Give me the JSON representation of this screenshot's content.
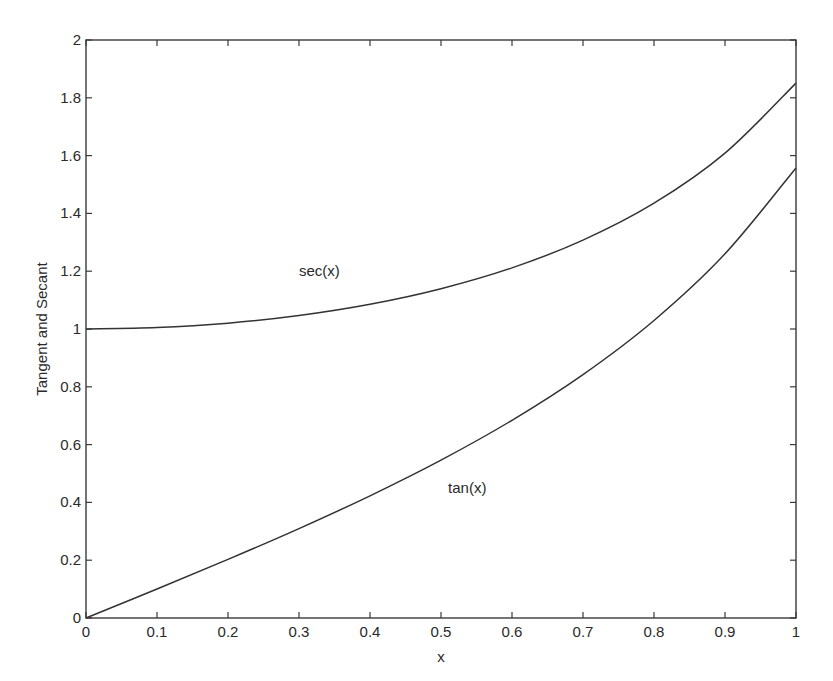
{
  "chart_data": {
    "type": "line",
    "title": "",
    "xlabel": "x",
    "ylabel": "Tangent and Secant",
    "xlim": [
      0,
      1
    ],
    "ylim": [
      0,
      2
    ],
    "grid": false,
    "legend": null,
    "x_ticks": [
      0,
      0.1,
      0.2,
      0.3,
      0.4,
      0.5,
      0.6,
      0.7,
      0.8,
      0.9,
      1
    ],
    "x_tick_labels": [
      "0",
      "0.1",
      "0.2",
      "0.3",
      "0.4",
      "0.5",
      "0.6",
      "0.7",
      "0.8",
      "0.9",
      "1"
    ],
    "y_ticks": [
      0,
      0.2,
      0.4,
      0.6,
      0.8,
      1,
      1.2,
      1.4,
      1.6,
      1.8,
      2
    ],
    "y_tick_labels": [
      "0",
      "0.2",
      "0.4",
      "0.6",
      "0.8",
      "1",
      "1.2",
      "1.4",
      "1.6",
      "1.8",
      "2"
    ],
    "x": [
      0,
      0.1,
      0.2,
      0.3,
      0.4,
      0.5,
      0.6,
      0.7,
      0.8,
      0.9,
      1.0
    ],
    "series": [
      {
        "name": "sec(x)",
        "color": "#333333",
        "values": [
          1.0,
          1.005,
          1.0203,
          1.0468,
          1.0857,
          1.1395,
          1.2116,
          1.3075,
          1.4353,
          1.6087,
          1.8508
        ]
      },
      {
        "name": "tan(x)",
        "color": "#333333",
        "values": [
          0.0,
          0.1003,
          0.2027,
          0.3093,
          0.4228,
          0.5463,
          0.6841,
          0.8423,
          1.0296,
          1.2602,
          1.5574
        ]
      }
    ],
    "annotations": [
      {
        "text": "sec(x)",
        "x": 0.3,
        "y": 1.2
      },
      {
        "text": "tan(x)",
        "x": 0.51,
        "y": 0.45
      }
    ]
  }
}
